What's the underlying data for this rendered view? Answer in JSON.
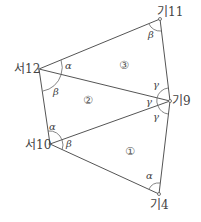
{
  "diagram": {
    "type": "triangulation-network",
    "points": {
      "p11": {
        "label": "기11",
        "x": 160,
        "y": 19
      },
      "p12": {
        "label": "서12",
        "x": 39,
        "y": 69
      },
      "p9": {
        "label": "기9",
        "x": 170,
        "y": 101
      },
      "p10": {
        "label": "서10",
        "x": 50,
        "y": 144
      },
      "p4": {
        "label": "기4",
        "x": 159,
        "y": 194
      }
    },
    "triangles": [
      {
        "label": "①",
        "vertices": [
          "서10",
          "기9",
          "기4"
        ]
      },
      {
        "label": "②",
        "vertices": [
          "서12",
          "기9",
          "서10"
        ]
      },
      {
        "label": "③",
        "vertices": [
          "서12",
          "기11",
          "기9"
        ]
      }
    ],
    "angles": {
      "alpha": "α",
      "beta": "β",
      "gamma": "γ"
    },
    "colors": {
      "line": "#555555",
      "text": "#444444"
    }
  }
}
